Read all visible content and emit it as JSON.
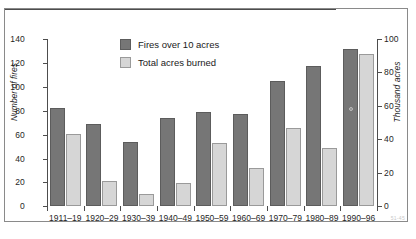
{
  "chart_data": {
    "type": "bar",
    "title": "",
    "subtitle": "",
    "categories": [
      "1911–19",
      "1920–29",
      "1930–39",
      "1940–49",
      "1950–59",
      "1960–69",
      "1970–79",
      "1980–89",
      "1990–96"
    ],
    "series": [
      {
        "name": "Fires over 10 acres",
        "axis": "left",
        "color": "#767676",
        "values": [
          82,
          69,
          54,
          74,
          79,
          77,
          105,
          117,
          132
        ]
      },
      {
        "name": "Total acres burned",
        "axis": "right",
        "color": "#d6d6d6",
        "values": [
          43,
          15,
          7,
          14,
          38,
          23,
          47,
          35,
          91
        ]
      }
    ],
    "xlabel": "",
    "ylabel": "Number of fires",
    "y2label": "Thousand acres",
    "ylim": [
      0,
      140
    ],
    "y2lim": [
      0,
      100
    ],
    "yticks": [
      0,
      20,
      40,
      60,
      80,
      100,
      120,
      140
    ],
    "y2ticks": [
      0,
      20,
      40,
      60,
      80,
      100
    ],
    "grid": false,
    "legend_position": "top-center"
  },
  "axes": {
    "left_title": "Number of fires",
    "right_title": "Thousand acres",
    "left_ticks": [
      "140",
      "120",
      "100",
      "80",
      "60",
      "40",
      "20",
      "0"
    ],
    "right_ticks": [
      "100",
      "80",
      "60",
      "40",
      "20",
      "0"
    ]
  },
  "legend": {
    "items": [
      {
        "label": "Fires over 10 acres",
        "swatch": "dark"
      },
      {
        "label": "Total acres burned",
        "swatch": "light"
      }
    ]
  },
  "footer": {
    "note": "51-45"
  }
}
